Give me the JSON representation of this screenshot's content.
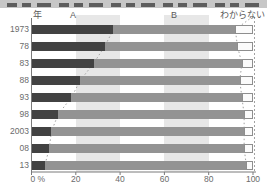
{
  "chart_data": {
    "type": "bar",
    "stacked": true,
    "orientation": "horizontal",
    "unit": "%",
    "y_axis_title": "年",
    "column_labels": {
      "a": "A",
      "b": "B",
      "dk": "わからない"
    },
    "categories": [
      "1973",
      "78",
      "83",
      "88",
      "93",
      "98",
      "2003",
      "08",
      "13"
    ],
    "series": [
      {
        "name": "A",
        "values": [
          37,
          33,
          28,
          22,
          18,
          12,
          9,
          8,
          6
        ],
        "color": "#424242"
      },
      {
        "name": "B",
        "values": [
          55,
          60,
          67,
          72,
          77,
          84,
          87,
          88,
          91
        ],
        "color": "#939393"
      },
      {
        "name": "わからない",
        "values": [
          8,
          7,
          5,
          6,
          5,
          4,
          4,
          4,
          3
        ],
        "color": "#fbfbfb"
      }
    ],
    "x_axis": {
      "ticks": [
        "0 %",
        "20",
        "40",
        "60",
        "80",
        "100"
      ],
      "values": [
        0,
        20,
        40,
        60,
        80,
        100
      ],
      "range": [
        0,
        100
      ]
    },
    "background_bands": [
      [
        20,
        40
      ],
      [
        60,
        80
      ]
    ],
    "legend_position": "top",
    "grid": false
  },
  "colors": {
    "segment_a": "#424242",
    "segment_b": "#939393",
    "segment_dk_fill": "#fbfbfb",
    "segment_dk_border": "#8e8e8e",
    "band": "#e7e7e7",
    "axis": "#7a7a7a",
    "dotted_line": "#a2a2a2",
    "label_text": "#6b6b6b"
  }
}
